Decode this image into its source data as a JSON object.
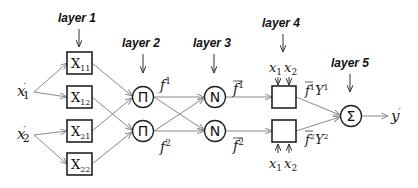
{
  "diagram": {
    "type": "ANFIS network architecture",
    "layers": [
      {
        "label": "layer 1"
      },
      {
        "label": "layer 2"
      },
      {
        "label": "layer 3"
      },
      {
        "label": "layer 4"
      },
      {
        "label": "layer 5"
      }
    ],
    "inputs": [
      {
        "symbol": "x",
        "prime": "′",
        "sub": "1"
      },
      {
        "symbol": "x",
        "prime": "′",
        "sub": "2"
      }
    ],
    "layer1_nodes": [
      {
        "main": "X",
        "sub": "11"
      },
      {
        "main": "X",
        "sub": "12"
      },
      {
        "main": "X",
        "sub": "21"
      },
      {
        "main": "X",
        "sub": "22"
      }
    ],
    "layer2_nodes": [
      {
        "glyph": "Π",
        "out_main": "f",
        "out_sup": "1"
      },
      {
        "glyph": "Π",
        "out_main": "f",
        "out_sup": "2"
      }
    ],
    "layer3_nodes": [
      {
        "glyph": "N",
        "out_main": "f",
        "out_sup": "1"
      },
      {
        "glyph": "N",
        "out_main": "f",
        "out_sup": "2"
      }
    ],
    "layer4_nodes": [
      {
        "inputs_label": [
          "x",
          "1",
          "x",
          "2"
        ],
        "out": "f¹Y¹",
        "out_main1": "f",
        "out_sup1": "1",
        "out_main2": "Y",
        "out_sup2": "1"
      },
      {
        "inputs_label": [
          "x",
          "1",
          "x",
          "2"
        ],
        "out": "f²Y²",
        "out_main1": "f",
        "out_sup1": "2",
        "out_main2": "Y",
        "out_sup2": "2"
      }
    ],
    "layer5_node": {
      "glyph": "Σ"
    },
    "output": {
      "symbol": "y",
      "prime": "′"
    }
  }
}
